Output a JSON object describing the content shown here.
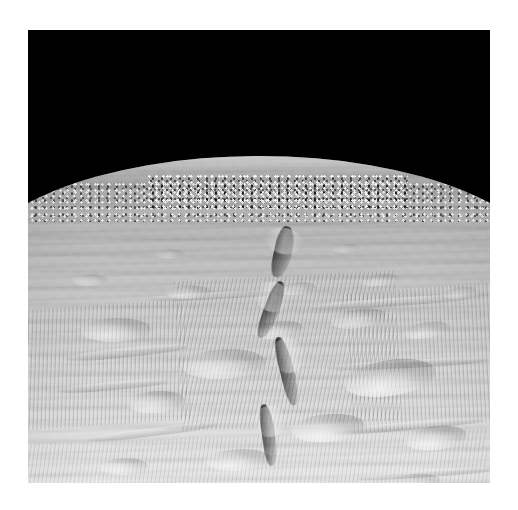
{
  "page": {
    "background_color": "#ffffff",
    "width": 518,
    "height": 510
  },
  "photo": {
    "alt_text": "Grayscale spacecraft photograph of an icy moon surface under black sky",
    "frame": {
      "x": 28,
      "y": 30,
      "width": 462,
      "height": 453
    },
    "sky_color": "#010101",
    "horizon_y_left": 168,
    "horizon_y_center": 158,
    "horizon_y_right": 172,
    "lighting": "low sun from lower-left, long shadows",
    "tone_range": {
      "darkest": "#000000",
      "midtone": "#a8a8a8",
      "brightest": "#ffffff"
    }
  },
  "scene": {
    "title": "Enceladus North Polar Region",
    "subject": "icy moon limb and cratered terrain",
    "features": [
      {
        "name": "black-sky",
        "label": "Space / black sky"
      },
      {
        "name": "limb-horizon",
        "label": "Curved horizon (limb)"
      },
      {
        "name": "central-fracture",
        "label": "Central fracture / chasm system"
      },
      {
        "name": "crater-field",
        "label": "Degraded crater field"
      },
      {
        "name": "lineated-terrain",
        "label": "Parallel grooves and ridges"
      },
      {
        "name": "foreground-plains",
        "label": "Bright foreground plains"
      }
    ]
  },
  "craters": [
    {
      "x": 362,
      "y": 348,
      "w": 92,
      "h": 36,
      "rot": -9,
      "op": 0.78
    },
    {
      "x": 300,
      "y": 398,
      "w": 74,
      "h": 28,
      "rot": -5,
      "op": 0.72
    },
    {
      "x": 408,
      "y": 408,
      "w": 62,
      "h": 24,
      "rot": -7,
      "op": 0.7
    },
    {
      "x": 196,
      "y": 334,
      "w": 84,
      "h": 30,
      "rot": -3,
      "op": 0.62
    },
    {
      "x": 88,
      "y": 300,
      "w": 70,
      "h": 24,
      "rot": -2,
      "op": 0.55
    },
    {
      "x": 128,
      "y": 372,
      "w": 58,
      "h": 22,
      "rot": -4,
      "op": 0.58
    },
    {
      "x": 250,
      "y": 300,
      "w": 50,
      "h": 18,
      "rot": -6,
      "op": 0.5
    },
    {
      "x": 330,
      "y": 288,
      "w": 56,
      "h": 19,
      "rot": -8,
      "op": 0.48
    },
    {
      "x": 398,
      "y": 300,
      "w": 46,
      "h": 16,
      "rot": -10,
      "op": 0.46
    },
    {
      "x": 160,
      "y": 262,
      "w": 44,
      "h": 14,
      "rot": -2,
      "op": 0.42
    },
    {
      "x": 268,
      "y": 258,
      "w": 40,
      "h": 13,
      "rot": -5,
      "op": 0.4
    },
    {
      "x": 352,
      "y": 250,
      "w": 38,
      "h": 12,
      "rot": -7,
      "op": 0.38
    },
    {
      "x": 62,
      "y": 250,
      "w": 36,
      "h": 12,
      "rot": -1,
      "op": 0.36
    },
    {
      "x": 432,
      "y": 262,
      "w": 34,
      "h": 11,
      "rot": -9,
      "op": 0.36
    },
    {
      "x": 210,
      "y": 430,
      "w": 66,
      "h": 22,
      "rot": -3,
      "op": 0.6
    },
    {
      "x": 96,
      "y": 436,
      "w": 48,
      "h": 17,
      "rot": -2,
      "op": 0.5
    },
    {
      "x": 386,
      "y": 452,
      "w": 54,
      "h": 17,
      "rot": -5,
      "op": 0.45
    },
    {
      "x": 300,
      "y": 462,
      "w": 42,
      "h": 14,
      "rot": -3,
      "op": 0.38
    },
    {
      "x": 142,
      "y": 224,
      "w": 30,
      "h": 10,
      "rot": 0,
      "op": 0.3
    },
    {
      "x": 318,
      "y": 218,
      "w": 28,
      "h": 9,
      "rot": -4,
      "op": 0.28
    }
  ],
  "fractures": [
    {
      "x": 246,
      "y": 196,
      "w": 18,
      "h": 52,
      "rot": 12
    },
    {
      "x": 236,
      "y": 250,
      "w": 15,
      "h": 60,
      "rot": 20
    },
    {
      "x": 252,
      "y": 306,
      "w": 14,
      "h": 70,
      "rot": -14
    },
    {
      "x": 234,
      "y": 374,
      "w": 13,
      "h": 62,
      "rot": -8
    }
  ],
  "scarps": [
    {
      "x": 40,
      "y": 318,
      "w": 120,
      "h": 9,
      "rot": -6
    },
    {
      "x": 30,
      "y": 352,
      "w": 110,
      "h": 8,
      "rot": -5
    },
    {
      "x": 60,
      "y": 398,
      "w": 130,
      "h": 8,
      "rot": -7
    },
    {
      "x": 282,
      "y": 268,
      "w": 170,
      "h": 8,
      "rot": -4
    },
    {
      "x": 300,
      "y": 330,
      "w": 160,
      "h": 8,
      "rot": -3
    },
    {
      "x": 306,
      "y": 392,
      "w": 150,
      "h": 8,
      "rot": -5
    },
    {
      "x": 120,
      "y": 262,
      "w": 140,
      "h": 7,
      "rot": -3
    },
    {
      "x": 330,
      "y": 440,
      "w": 140,
      "h": 7,
      "rot": -4
    },
    {
      "x": 60,
      "y": 460,
      "w": 180,
      "h": 7,
      "rot": -3
    }
  ]
}
